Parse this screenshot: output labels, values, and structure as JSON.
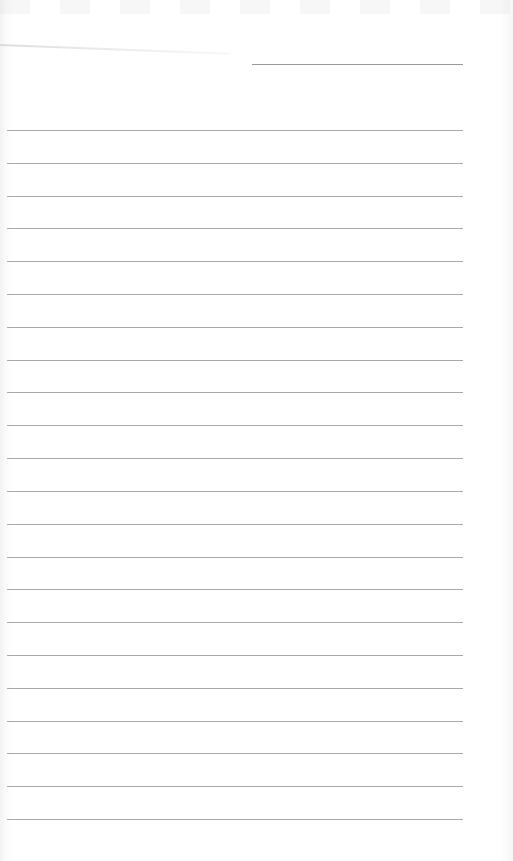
{
  "document": {
    "type": "blank lined paper",
    "header": {
      "label": "name-line",
      "text": ""
    },
    "ruled_lines": {
      "count": 22,
      "entries": [
        "",
        "",
        "",
        "",
        "",
        "",
        "",
        "",
        "",
        "",
        "",
        "",
        "",
        "",
        "",
        "",
        "",
        "",
        "",
        "",
        "",
        ""
      ]
    },
    "colors": {
      "paper": "#ffffff",
      "line": "#a9a9a9",
      "header_line": "#9a9a9a"
    }
  }
}
